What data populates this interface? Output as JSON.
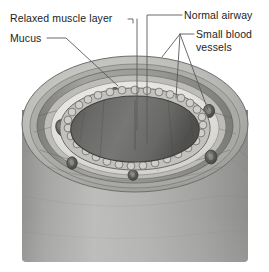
{
  "figure": {
    "style": "grayscale medical illustration",
    "background_color": "#ffffff"
  },
  "labels": [
    {
      "id": "relaxed-muscle-layer",
      "text": "Relaxed muscle layer",
      "lines": [
        "Relaxed muscle layer"
      ],
      "align": "left",
      "leader": "elbow-down"
    },
    {
      "id": "mucus",
      "text": "Mucus",
      "lines": [
        "Mucus"
      ],
      "align": "left",
      "leader": "diagonal"
    },
    {
      "id": "normal-airway",
      "text": "Normal airway",
      "lines": [
        "Normal airway"
      ],
      "align": "right",
      "leader": "elbow-down"
    },
    {
      "id": "small-blood-vessels",
      "text": "Small blood vessels",
      "lines": [
        "Small blood",
        "vessels"
      ],
      "align": "right",
      "leader": "forked"
    }
  ],
  "anatomy": {
    "lumen": {
      "name": "Airway lumen",
      "fill": "#5d5d5d",
      "state": "open"
    },
    "mucosa": {
      "name": "Mucosal epithelium",
      "fill": "#b9b9b9",
      "appearance": "beaded cell ring"
    },
    "submucosa": {
      "name": "Submucosa",
      "fill": "#e8e7e3"
    },
    "muscle_layer": {
      "name": "Relaxed smooth muscle layer",
      "fill": "#9a9a98",
      "state": "relaxed"
    },
    "outer_wall": {
      "name": "Outer airway wall",
      "fill": "#8e8e8c"
    },
    "tube_body": {
      "name": "Airway tube body",
      "fill": "#a9a9a7"
    },
    "blood_vessels": {
      "name": "Small blood vessels",
      "fill": "#6e6e6c",
      "count": 8
    }
  },
  "colors": {
    "text": "#1d1d1d",
    "leader_line": "#5a5a5a",
    "background": "#ffffff"
  }
}
